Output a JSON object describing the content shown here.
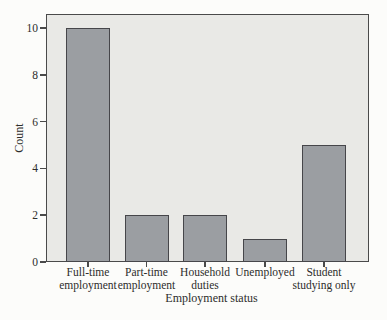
{
  "colors": {
    "background": "#fcfcfa",
    "plot_background": "#e9e9e6",
    "frame": "#4a4a4a",
    "bar_fill": "#9b9ea2",
    "bar_border": "#46464a",
    "text": "#2d2d2b"
  },
  "chart_data": {
    "type": "bar",
    "title": "",
    "xlabel": "Employment status",
    "ylabel": "Count",
    "categories": [
      "Full-time employment",
      "Part-time employment",
      "Household duties",
      "Unemployed",
      "Student studying only"
    ],
    "category_lines": [
      [
        "Full-time",
        "employment"
      ],
      [
        "Part-time",
        "employment"
      ],
      [
        "Household",
        "duties"
      ],
      [
        "Unemployed"
      ],
      [
        "Student",
        "studying only"
      ]
    ],
    "values": [
      10,
      2,
      2,
      1,
      5
    ],
    "yticks": [
      0,
      2,
      4,
      6,
      8,
      10
    ],
    "ylim": [
      0,
      10.6
    ],
    "bar_color": "#9b9ea2",
    "grid": false,
    "legend": "none"
  }
}
